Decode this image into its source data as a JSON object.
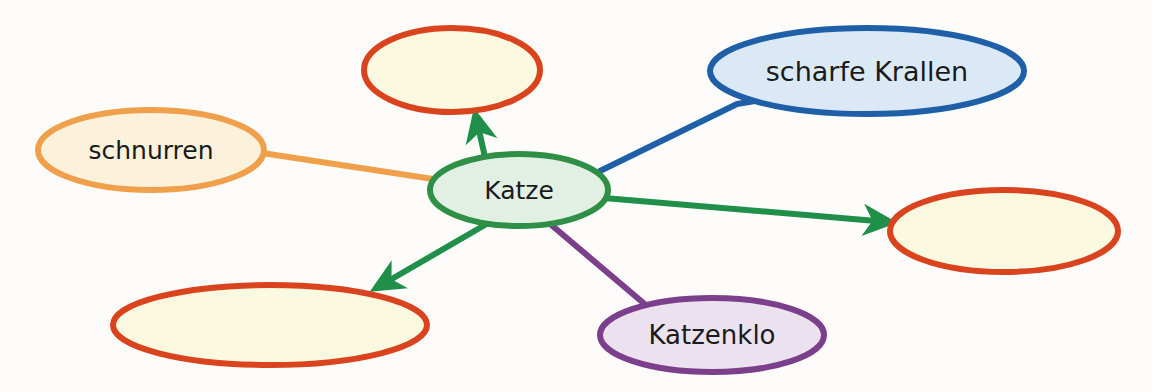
{
  "diagram": {
    "type": "mind-map",
    "language": "de",
    "background_color": "#fdfcfa",
    "center_node": {
      "label": "Katze",
      "stroke_color": "#2f8f46",
      "fill_color": "#e2f0e4",
      "cx": 519,
      "cy": 190,
      "rx": 89,
      "ry": 36
    },
    "nodes": [
      {
        "id": "node-top-empty",
        "label": "",
        "stroke_color": "#d9441f",
        "fill_color": "#fbfae0",
        "cx": 452,
        "cy": 70,
        "rx": 88,
        "ry": 42,
        "filled_in": false
      },
      {
        "id": "node-scharfe-krallen",
        "label": "scharfe Krallen",
        "stroke_color": "#1f5fa8",
        "fill_color": "#dbe9f6",
        "cx": 867,
        "cy": 71,
        "rx": 157,
        "ry": 43,
        "filled_in": true
      },
      {
        "id": "node-schnurren",
        "label": "schnurren",
        "stroke_color": "#f0a04b",
        "fill_color": "#fcf2dc",
        "cx": 151,
        "cy": 150,
        "rx": 113,
        "ry": 40,
        "filled_in": true
      },
      {
        "id": "node-right-empty",
        "label": "",
        "stroke_color": "#d9441f",
        "fill_color": "#fbfae0",
        "cx": 1004,
        "cy": 231,
        "rx": 114,
        "ry": 41,
        "filled_in": false
      },
      {
        "id": "node-bottomleft-empty",
        "label": "",
        "stroke_color": "#d9441f",
        "fill_color": "#fbfae0",
        "cx": 270,
        "cy": 325,
        "rx": 157,
        "ry": 40,
        "filled_in": false
      },
      {
        "id": "node-katzenklo",
        "label": "Katzenklo",
        "stroke_color": "#7b3f8c",
        "fill_color": "#ece2ef",
        "cx": 712,
        "cy": 335,
        "rx": 112,
        "ry": 37,
        "filled_in": true
      }
    ],
    "connectors": [
      {
        "id": "connector-schnurren",
        "from": "node-schnurren",
        "to": "center_node",
        "color": "#f0a04b",
        "arrow": false,
        "points": "262,153 433,179"
      },
      {
        "id": "connector-scharfe-krallen",
        "from": "center_node",
        "to": "node-scharfe-krallen",
        "color": "#1f5fa8",
        "arrow": false,
        "points": "600,171 737,104 766,99"
      },
      {
        "id": "connector-katzenklo",
        "from": "center_node",
        "to": "node-katzenklo",
        "color": "#7b3f8c",
        "arrow": false,
        "points": "549,223 647,306"
      },
      {
        "id": "connector-arrow-top",
        "from": "center_node",
        "to": "node-top-empty",
        "color": "#1f8f4a",
        "arrow": true,
        "points": "487,166 476,117"
      },
      {
        "id": "connector-arrow-right",
        "from": "center_node",
        "to": "node-right-empty",
        "color": "#1f8f4a",
        "arrow": true,
        "points": "604,198 888,222"
      },
      {
        "id": "connector-arrow-bottomleft",
        "from": "center_node",
        "to": "node-bottomleft-empty",
        "color": "#1f8f4a",
        "arrow": true,
        "points": "490,222 378,287"
      }
    ]
  }
}
